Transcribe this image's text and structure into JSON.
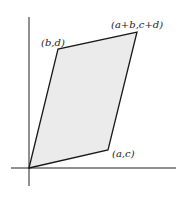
{
  "diagram": {
    "colors": {
      "fill": "#ebebeb",
      "stroke": "#1a1a1a",
      "axis": "#222222"
    },
    "labels": {
      "origin_to_ac": "(a,c)",
      "origin_to_bd": "(b,d)",
      "sum": "(a+b,c+d)"
    }
  }
}
